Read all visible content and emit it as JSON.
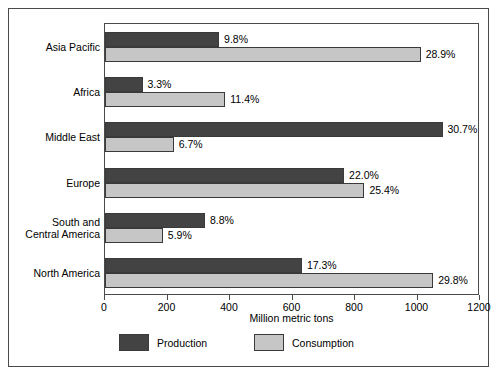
{
  "chart_data": {
    "type": "bar",
    "orientation": "horizontal",
    "title": "",
    "xlabel": "Million metric tons",
    "ylabel": "",
    "xlim": [
      0,
      1200
    ],
    "xticks": [
      0,
      200,
      400,
      600,
      800,
      1000,
      1200
    ],
    "xtick_labels": [
      "0",
      "200",
      "400",
      "600",
      "800",
      "1000",
      "1200"
    ],
    "grid": false,
    "legend_position": "bottom",
    "categories": [
      "Asia Pacific",
      "Africa",
      "Middle East",
      "Europe",
      "South and\nCentral America",
      "North America"
    ],
    "series": [
      {
        "name": "Production",
        "color": "#434343",
        "values": [
          365,
          120,
          1080,
          765,
          320,
          630
        ],
        "labels": [
          "9.8%",
          "3.3%",
          "30.7%",
          "22.0%",
          "8.8%",
          "17.3%"
        ]
      },
      {
        "name": "Consumption",
        "color": "#c6c6c6",
        "values": [
          1010,
          385,
          220,
          830,
          185,
          1050
        ],
        "labels": [
          "28.9%",
          "11.4%",
          "6.7%",
          "25.4%",
          "5.9%",
          "29.8%"
        ]
      }
    ]
  },
  "legend": {
    "production_label": "Production",
    "consumption_label": "Consumption"
  },
  "axis": {
    "x_title": "Million metric tons"
  }
}
